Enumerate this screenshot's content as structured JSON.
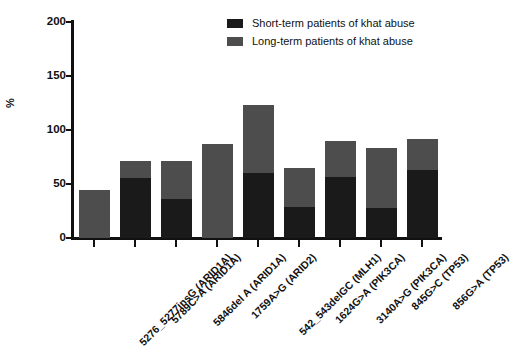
{
  "chart_data": {
    "type": "bar",
    "subtype": "stacked-vertical",
    "title": "",
    "xlabel": "",
    "ylabel": "%",
    "ylim": [
      0,
      200
    ],
    "yticks": [
      0,
      50,
      100,
      150,
      200
    ],
    "grid": false,
    "legend_position": "top-right",
    "categories": [
      "5276_5277insG (ARID1A)",
      "5789C>A (ARID1A)",
      "5846del A (ARID1A)",
      "1759A>G (ARID2)",
      "542_543delGC (MLH1)",
      "1624G>A (PIK3CA)",
      "3140A>G (PIK3CA)",
      "845G>C (TP53)",
      "856G>A (TP53)"
    ],
    "series": [
      {
        "name": "Short-term patients of khat abuse",
        "color": "#1a1a1a",
        "values": [
          0,
          55,
          36,
          0,
          60,
          29,
          56,
          28,
          63
        ]
      },
      {
        "name": "Long-term patients of khat abuse",
        "color": "#4d4d4d",
        "values": [
          44,
          16,
          35,
          87,
          63,
          36,
          33,
          55,
          28
        ]
      }
    ],
    "totals": [
      44,
      71,
      71,
      87,
      123,
      65,
      89,
      83,
      91
    ]
  },
  "legend": {
    "items": [
      {
        "label": "Short-term patients of khat abuse",
        "color": "#1a1a1a"
      },
      {
        "label": "Long-term patients of khat abuse",
        "color": "#4d4d4d"
      }
    ]
  },
  "axis": {
    "y_label": "%",
    "y_tick_labels": [
      "200",
      "150",
      "100",
      "50",
      "0"
    ]
  }
}
